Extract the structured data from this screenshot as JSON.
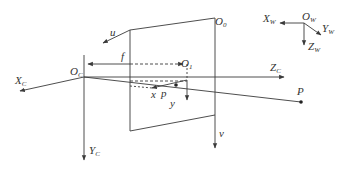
{
  "diagram": {
    "colors": {
      "stroke": "#3a3a3a",
      "text": "#333333",
      "background": "#ffffff"
    },
    "labels": {
      "o_c": {
        "main": "O",
        "sub": "C"
      },
      "x_c": {
        "main": "X",
        "sub": "C"
      },
      "y_c": {
        "main": "Y",
        "sub": "C"
      },
      "z_c": {
        "main": "Z",
        "sub": "C"
      },
      "o_0": {
        "main": "O",
        "sub": "0"
      },
      "o_1": {
        "main": "O",
        "sub": "1"
      },
      "u": {
        "main": "u"
      },
      "v": {
        "main": "v"
      },
      "x": {
        "main": "x"
      },
      "y": {
        "main": "y"
      },
      "f": {
        "main": "f"
      },
      "p": {
        "main": "p"
      },
      "P": {
        "main": "P"
      },
      "o_w": {
        "main": "O",
        "sub": "W"
      },
      "x_w": {
        "main": "X",
        "sub": "W"
      },
      "y_w": {
        "main": "Y",
        "sub": "W"
      },
      "z_w": {
        "main": "Z",
        "sub": "W"
      }
    }
  }
}
